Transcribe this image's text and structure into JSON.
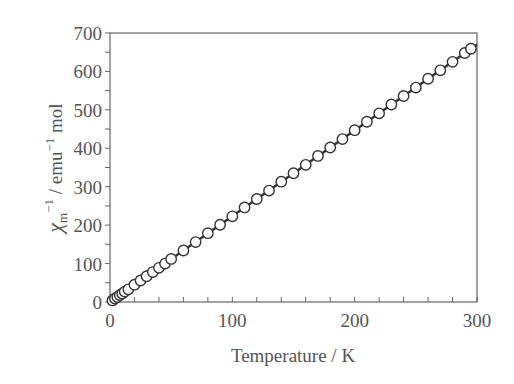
{
  "chart_data": {
    "type": "scatter",
    "title": "",
    "xlabel": "Temperature / K",
    "ylabel": "χm−1 / emu−1 mol",
    "ylabel_parts": {
      "symbol": "χ",
      "subscript": "m",
      "sup1": "−1",
      "middle": " / emu",
      "sup2": "−1",
      "tail": " mol"
    },
    "xlim": [
      0,
      300
    ],
    "ylim": [
      0,
      700
    ],
    "x_ticks": [
      0,
      100,
      200,
      300
    ],
    "x_minor_step": 20,
    "y_ticks": [
      0,
      100,
      200,
      300,
      400,
      500,
      600,
      700
    ],
    "y_minor_step": 50,
    "grid": false,
    "legend": null,
    "series": [
      {
        "name": "experimental",
        "marker": "open-circle",
        "x": [
          2,
          4,
          6,
          8,
          10,
          12,
          15,
          20,
          25,
          30,
          35,
          40,
          45,
          50,
          60,
          70,
          80,
          90,
          100,
          110,
          120,
          130,
          140,
          150,
          160,
          170,
          180,
          190,
          200,
          210,
          220,
          230,
          240,
          250,
          260,
          270,
          280,
          290,
          295
        ],
        "y": [
          4,
          9,
          13,
          18,
          22,
          27,
          33,
          45,
          56,
          67,
          78,
          89,
          100,
          112,
          134,
          156,
          179,
          201,
          223,
          246,
          268,
          290,
          313,
          335,
          357,
          380,
          402,
          424,
          447,
          469,
          491,
          514,
          536,
          558,
          581,
          603,
          625,
          648,
          659
        ]
      },
      {
        "name": "Curie-Weiss fit",
        "line": "solid",
        "x": [
          0,
          300
        ],
        "y": [
          0,
          670
        ]
      }
    ]
  }
}
